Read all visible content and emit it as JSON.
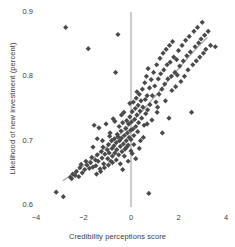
{
  "chart_data": {
    "type": "scatter",
    "title": "",
    "xlabel": "Credibility perceptions score",
    "ylabel": "Likelihood of new investment (percent)",
    "xlim": [
      -4,
      4
    ],
    "ylim": [
      0.6,
      0.9
    ],
    "xticks": [
      -4,
      -2,
      0,
      2,
      4
    ],
    "xtick_labels": [
      "−4",
      "−2",
      "0",
      "2",
      "4"
    ],
    "yticks": [
      0.6,
      0.7,
      0.8,
      0.9
    ],
    "ytick_labels": [
      "0.6",
      "0.7",
      "0.8",
      "0.9"
    ],
    "grid": false,
    "legend": "none",
    "marker": "diamond",
    "marker_color": "#4a4a4a",
    "marker_size": 4,
    "reference_line": {
      "orientation": "vertical",
      "x": 0,
      "color": "#8c8c8c"
    },
    "fit_line": {
      "label": "smoothed fit",
      "color": "#a8a8a8",
      "points": [
        [
          -2.85,
          0.638
        ],
        [
          -2.4,
          0.65
        ],
        [
          -2.0,
          0.661
        ],
        [
          -1.6,
          0.673
        ],
        [
          -1.2,
          0.685
        ],
        [
          -0.8,
          0.698
        ],
        [
          -0.4,
          0.712
        ],
        [
          0.0,
          0.727
        ],
        [
          0.4,
          0.743
        ],
        [
          0.8,
          0.76
        ],
        [
          1.2,
          0.777
        ],
        [
          1.6,
          0.795
        ],
        [
          2.0,
          0.812
        ],
        [
          2.4,
          0.829
        ],
        [
          2.8,
          0.845
        ],
        [
          3.2,
          0.86
        ]
      ]
    },
    "points": [
      [
        -3.15,
        0.62
      ],
      [
        -2.85,
        0.613
      ],
      [
        -2.75,
        0.876
      ],
      [
        -2.55,
        0.643
      ],
      [
        -2.5,
        0.641
      ],
      [
        -2.45,
        0.648
      ],
      [
        -2.35,
        0.646
      ],
      [
        -2.3,
        0.652
      ],
      [
        -2.2,
        0.644
      ],
      [
        -2.15,
        0.658
      ],
      [
        -2.1,
        0.663
      ],
      [
        -2.05,
        0.65
      ],
      [
        -1.95,
        0.655
      ],
      [
        -1.9,
        0.668
      ],
      [
        -1.85,
        0.662
      ],
      [
        -1.8,
        0.843
      ],
      [
        -1.75,
        0.657
      ],
      [
        -1.7,
        0.666
      ],
      [
        -1.65,
        0.674
      ],
      [
        -1.6,
        0.659
      ],
      [
        -1.55,
        0.724
      ],
      [
        -1.5,
        0.67
      ],
      [
        -1.48,
        0.661
      ],
      [
        -1.42,
        0.678
      ],
      [
        -1.38,
        0.668
      ],
      [
        -1.35,
        0.72
      ],
      [
        -1.3,
        0.656
      ],
      [
        -1.25,
        0.683
      ],
      [
        -1.22,
        0.673
      ],
      [
        -1.18,
        0.69
      ],
      [
        -1.15,
        0.664
      ],
      [
        -1.1,
        0.679
      ],
      [
        -1.05,
        0.726
      ],
      [
        -1.0,
        0.686
      ],
      [
        -0.98,
        0.672
      ],
      [
        -0.95,
        0.694
      ],
      [
        -0.92,
        0.681
      ],
      [
        -0.88,
        0.712
      ],
      [
        -0.85,
        0.668
      ],
      [
        -0.82,
        0.7
      ],
      [
        -0.8,
        0.688
      ],
      [
        -0.78,
        0.676
      ],
      [
        -0.75,
        0.734
      ],
      [
        -0.72,
        0.692
      ],
      [
        -0.7,
        0.703
      ],
      [
        -0.68,
        0.681
      ],
      [
        -0.65,
        0.806
      ],
      [
        -0.62,
        0.697
      ],
      [
        -0.6,
        0.686
      ],
      [
        -0.58,
        0.71
      ],
      [
        -0.55,
        0.865
      ],
      [
        -0.52,
        0.678
      ],
      [
        -0.5,
        0.722
      ],
      [
        -0.48,
        0.7
      ],
      [
        -0.45,
        0.691
      ],
      [
        -0.42,
        0.715
      ],
      [
        -0.4,
        0.704
      ],
      [
        -0.38,
        0.683
      ],
      [
        -0.35,
        0.728
      ],
      [
        -0.32,
        0.695
      ],
      [
        -0.3,
        0.744
      ],
      [
        -0.28,
        0.708
      ],
      [
        -0.25,
        0.687
      ],
      [
        -0.22,
        0.719
      ],
      [
        -0.2,
        0.7
      ],
      [
        -0.18,
        0.731
      ],
      [
        -0.15,
        0.712
      ],
      [
        -0.12,
        0.693
      ],
      [
        -0.1,
        0.726
      ],
      [
        -0.08,
        0.705
      ],
      [
        -0.05,
        0.737
      ],
      [
        -0.02,
        0.716
      ],
      [
        0.0,
        0.702
      ],
      [
        0.02,
        0.729
      ],
      [
        0.05,
        0.745
      ],
      [
        0.08,
        0.718
      ],
      [
        0.1,
        0.76
      ],
      [
        0.12,
        0.708
      ],
      [
        0.15,
        0.733
      ],
      [
        0.18,
        0.75
      ],
      [
        0.2,
        0.722
      ],
      [
        0.22,
        0.766
      ],
      [
        0.25,
        0.74
      ],
      [
        0.28,
        0.714
      ],
      [
        0.3,
        0.755
      ],
      [
        0.32,
        0.728
      ],
      [
        0.35,
        0.772
      ],
      [
        0.38,
        0.746
      ],
      [
        0.4,
        0.7
      ],
      [
        0.42,
        0.762
      ],
      [
        0.45,
        0.735
      ],
      [
        0.48,
        0.78
      ],
      [
        0.5,
        0.752
      ],
      [
        0.55,
        0.724
      ],
      [
        0.58,
        0.79
      ],
      [
        0.6,
        0.764
      ],
      [
        0.62,
        0.742
      ],
      [
        0.65,
        0.8
      ],
      [
        0.68,
        0.77
      ],
      [
        0.7,
        0.748
      ],
      [
        0.72,
        0.812
      ],
      [
        0.75,
        0.618
      ],
      [
        0.78,
        0.782
      ],
      [
        0.8,
        0.756
      ],
      [
        0.85,
        0.795
      ],
      [
        0.88,
        0.732
      ],
      [
        0.9,
        0.77
      ],
      [
        0.95,
        0.806
      ],
      [
        1.0,
        0.785
      ],
      [
        1.05,
        0.76
      ],
      [
        1.08,
        0.818
      ],
      [
        1.1,
        0.744
      ],
      [
        1.15,
        0.796
      ],
      [
        1.18,
        0.772
      ],
      [
        1.22,
        0.828
      ],
      [
        1.25,
        0.804
      ],
      [
        1.3,
        0.78
      ],
      [
        1.32,
        0.712
      ],
      [
        1.35,
        0.836
      ],
      [
        1.38,
        0.81
      ],
      [
        1.42,
        0.788
      ],
      [
        1.45,
        0.762
      ],
      [
        1.48,
        0.842
      ],
      [
        1.52,
        0.818
      ],
      [
        1.55,
        0.796
      ],
      [
        1.6,
        0.735
      ],
      [
        1.62,
        0.848
      ],
      [
        1.65,
        0.822
      ],
      [
        1.7,
        0.8
      ],
      [
        1.72,
        0.778
      ],
      [
        1.75,
        0.854
      ],
      [
        1.8,
        0.83
      ],
      [
        1.85,
        0.806
      ],
      [
        1.88,
        0.784
      ],
      [
        1.92,
        0.826
      ],
      [
        1.95,
        0.802
      ],
      [
        2.0,
        0.84
      ],
      [
        2.05,
        0.816
      ],
      [
        2.1,
        0.792
      ],
      [
        2.15,
        0.848
      ],
      [
        2.2,
        0.824
      ],
      [
        2.25,
        0.8
      ],
      [
        2.3,
        0.856
      ],
      [
        2.35,
        0.832
      ],
      [
        2.4,
        0.81
      ],
      [
        2.45,
        0.862
      ],
      [
        2.5,
        0.838
      ],
      [
        2.55,
        0.744
      ],
      [
        2.6,
        0.818
      ],
      [
        2.65,
        0.87
      ],
      [
        2.7,
        0.846
      ],
      [
        2.75,
        0.824
      ],
      [
        2.8,
        0.876
      ],
      [
        2.85,
        0.852
      ],
      [
        2.9,
        0.83
      ],
      [
        2.95,
        0.858
      ],
      [
        3.0,
        0.884
      ],
      [
        3.05,
        0.836
      ],
      [
        3.1,
        0.864
      ],
      [
        3.15,
        0.842
      ],
      [
        3.25,
        0.87
      ],
      [
        3.35,
        0.848
      ],
      [
        3.55,
        0.846
      ],
      [
        -1.45,
        0.648
      ],
      [
        -1.28,
        0.652
      ],
      [
        -1.12,
        0.658
      ],
      [
        -0.95,
        0.662
      ],
      [
        -0.78,
        0.666
      ],
      [
        -0.62,
        0.67
      ],
      [
        -0.45,
        0.664
      ],
      [
        -0.28,
        0.676
      ],
      [
        -0.12,
        0.668
      ],
      [
        0.05,
        0.68
      ],
      [
        0.2,
        0.672
      ],
      [
        -0.35,
        0.655
      ],
      [
        -0.18,
        0.69
      ],
      [
        0.0,
        0.684
      ],
      [
        0.12,
        0.694
      ],
      [
        -0.55,
        0.706
      ],
      [
        -0.4,
        0.74
      ],
      [
        -0.68,
        0.73
      ],
      [
        -0.9,
        0.707
      ],
      [
        -1.6,
        0.69
      ],
      [
        -1.42,
        0.703
      ],
      [
        -1.2,
        0.7
      ],
      [
        -0.05,
        0.758
      ],
      [
        0.35,
        0.688
      ],
      [
        0.52,
        0.705
      ],
      [
        0.68,
        0.726
      ],
      [
        1.12,
        0.752
      ],
      [
        0.25,
        0.776
      ]
    ]
  }
}
